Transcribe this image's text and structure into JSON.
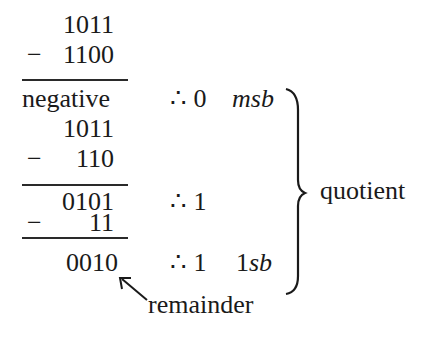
{
  "division": {
    "steps": [
      {
        "dividend": "1011",
        "subtrahend": "1100",
        "result": "negative",
        "quotient_bit": "∴ 0",
        "bit_label": "msb"
      },
      {
        "dividend": "1011",
        "subtrahend": "110",
        "result": "0101",
        "quotient_bit": "∴ 1",
        "bit_label": ""
      },
      {
        "dividend": "0101",
        "subtrahend": "11",
        "result": "0010",
        "quotient_bit": "∴ 1",
        "bit_label": "1sb"
      }
    ],
    "minus_sign": "−",
    "quotient_label": "quotient",
    "remainder_label": "remainder"
  }
}
